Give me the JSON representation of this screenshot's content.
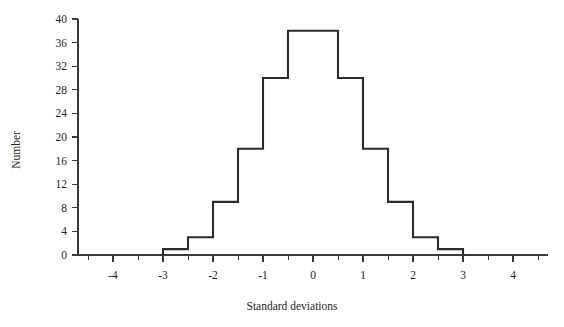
{
  "chart_data": {
    "type": "bar",
    "title": "",
    "subtitle": "",
    "xlabel": "Standard deviations",
    "ylabel": "Number",
    "xlim": [
      -4.7,
      4.7
    ],
    "ylim": [
      0,
      40
    ],
    "grid": false,
    "legend": null,
    "bin_width": 0.5,
    "style": "step-outline histogram",
    "x_tick_labels": [
      "-4",
      "-3",
      "-2",
      "-1",
      "0",
      "1",
      "2",
      "3",
      "4"
    ],
    "x_tick_values": [
      -4,
      -3,
      -2,
      -1,
      0,
      1,
      2,
      3,
      4
    ],
    "x_minor_tick_values": [
      -4.5,
      -3.5,
      -2.5,
      -1.5,
      -0.5,
      0.5,
      1.5,
      2.5,
      3.5,
      4.5
    ],
    "y_tick_labels": [
      "0",
      "4",
      "8",
      "12",
      "16",
      "20",
      "24",
      "28",
      "32",
      "36",
      "40"
    ],
    "y_tick_values": [
      0,
      4,
      8,
      12,
      16,
      20,
      24,
      28,
      32,
      36,
      40
    ],
    "bin_edges": [
      -3.0,
      -2.5,
      -2.0,
      -1.5,
      -1.0,
      -0.5,
      0.0,
      0.5,
      1.0,
      1.5,
      2.0,
      2.5,
      3.0
    ],
    "categories": [
      "-3.0 to -2.5",
      "-2.5 to -2.0",
      "-2.0 to -1.5",
      "-1.5 to -1.0",
      "-1.0 to -0.5",
      "-0.5 to 0.0",
      "0.0 to 0.5",
      "0.5 to 1.0",
      "1.0 to 1.5",
      "1.5 to 2.0",
      "2.0 to 2.5",
      "2.5 to 3.0"
    ],
    "values": [
      1,
      3,
      9,
      18,
      30,
      38,
      38,
      30,
      18,
      9,
      3,
      1
    ]
  },
  "colors": {
    "line": "#2b2b2b",
    "axis": "#3a3a3a",
    "text": "#231f20",
    "background": "#ffffff"
  }
}
